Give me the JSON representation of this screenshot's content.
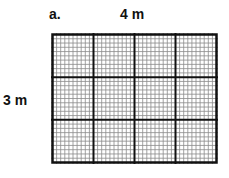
{
  "part_label": "a.",
  "width_label": "4 m",
  "height_label": "3 m",
  "grid": {
    "major_columns": 4,
    "major_rows": 3,
    "minor_per_major": 10,
    "left": 51,
    "top": 33,
    "width": 167,
    "height": 131,
    "major_color": "#111111",
    "minor_color": "#8a8a8a"
  }
}
